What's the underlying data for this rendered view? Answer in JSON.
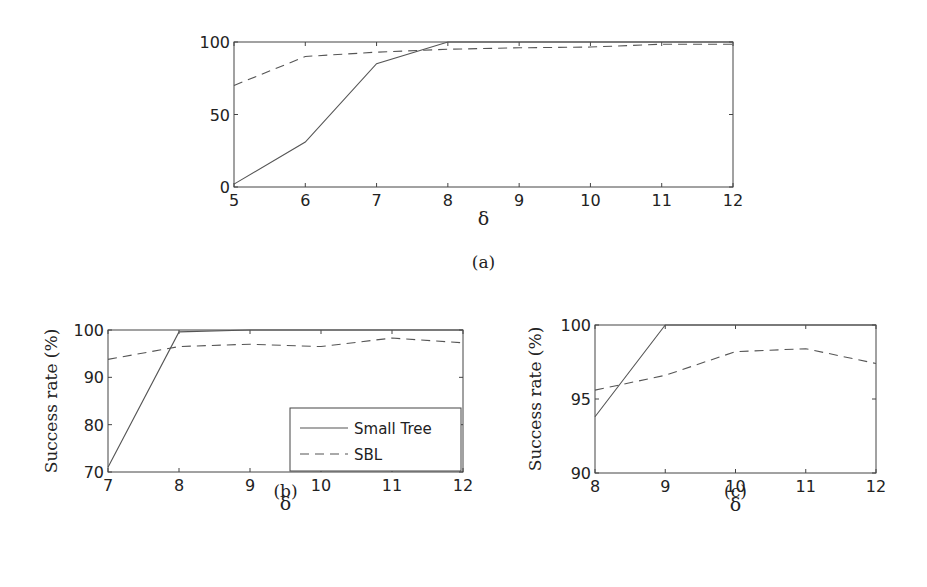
{
  "chart_data": [
    {
      "id": "a",
      "type": "line",
      "caption": "(a)",
      "title": "",
      "xlabel": "δ",
      "ylabel": "",
      "xlim": [
        5,
        12
      ],
      "ylim": [
        0,
        100
      ],
      "xticks": [
        "5",
        "6",
        "7",
        "8",
        "9",
        "10",
        "11",
        "12"
      ],
      "yticks": [
        "0",
        "50",
        "100"
      ],
      "grid": false,
      "x": [
        5,
        6,
        7,
        8,
        9,
        10,
        11,
        12
      ],
      "series": [
        {
          "name": "Small Tree",
          "style": "solid",
          "values": [
            2,
            31,
            85,
            100,
            100,
            100,
            100,
            100
          ]
        },
        {
          "name": "SBL",
          "style": "dashed",
          "values": [
            70,
            90,
            93,
            95,
            96,
            96.5,
            98.5,
            98.5
          ]
        }
      ]
    },
    {
      "id": "b",
      "type": "line",
      "caption": "(b)",
      "title": "",
      "xlabel": "δ",
      "ylabel": "Success rate (%)",
      "xlim": [
        7,
        12
      ],
      "ylim": [
        70,
        100
      ],
      "xticks": [
        "7",
        "8",
        "9",
        "10",
        "11",
        "12"
      ],
      "yticks": [
        "70",
        "80",
        "90",
        "100"
      ],
      "grid": false,
      "legend": {
        "position": "lower right",
        "entries": [
          "Small Tree",
          "SBL"
        ]
      },
      "x": [
        7,
        8,
        9,
        10,
        11,
        12
      ],
      "series": [
        {
          "name": "Small Tree",
          "style": "solid",
          "values": [
            71,
            99.6,
            100,
            100,
            100,
            100
          ]
        },
        {
          "name": "SBL",
          "style": "dashed",
          "values": [
            93.8,
            96.5,
            97,
            96.5,
            98.3,
            97.3
          ]
        }
      ]
    },
    {
      "id": "c",
      "type": "line",
      "caption": "(c)",
      "title": "",
      "xlabel": "δ",
      "ylabel": "Success rate (%)",
      "xlim": [
        8,
        12
      ],
      "ylim": [
        90,
        100
      ],
      "xticks": [
        "8",
        "9",
        "10",
        "11",
        "12"
      ],
      "yticks": [
        "90",
        "95",
        "100"
      ],
      "grid": false,
      "x": [
        8,
        9,
        10,
        11,
        12
      ],
      "series": [
        {
          "name": "Small Tree",
          "style": "solid",
          "values": [
            93.8,
            100,
            100,
            100,
            100
          ]
        },
        {
          "name": "SBL",
          "style": "dashed",
          "values": [
            95.6,
            96.6,
            98.2,
            98.4,
            97.4
          ]
        }
      ]
    }
  ]
}
